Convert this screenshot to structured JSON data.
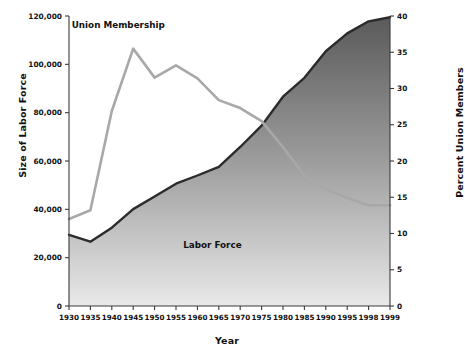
{
  "chart_data": {
    "type": "line",
    "title": "",
    "xlabel": "Year",
    "ylabel": "Size of Labor Force",
    "ylabel_right": "Percent Union Members",
    "categories": [
      "1930",
      "1935",
      "1940",
      "1945",
      "1950",
      "1955",
      "1960",
      "1965",
      "1970",
      "1975",
      "1980",
      "1985",
      "1990",
      "1995",
      "1998",
      "1999"
    ],
    "x": [
      1930,
      1935,
      1940,
      1945,
      1950,
      1955,
      1960,
      1965,
      1970,
      1975,
      1980,
      1985,
      1990,
      1995,
      1998,
      1999
    ],
    "xlim": [
      1930,
      1999
    ],
    "ylim": [
      0,
      120000
    ],
    "ylim_right": [
      0,
      40
    ],
    "yticks": [
      0,
      20000,
      40000,
      60000,
      80000,
      100000,
      120000
    ],
    "ytick_labels": [
      "0",
      "20,000",
      "40,000",
      "60,000",
      "80,000",
      "100,000",
      "120,000"
    ],
    "yticks_right": [
      0,
      5,
      10,
      15,
      20,
      25,
      30,
      35,
      40
    ],
    "ytick_labels_right": [
      "0",
      "5",
      "10",
      "15",
      "20",
      "25",
      "30",
      "35",
      "40"
    ],
    "grid": false,
    "legend_position": "inline-annotations",
    "series": [
      {
        "name": "Labor Force",
        "axis": "left",
        "type": "area",
        "units": "thousands of workers",
        "color": "#6e6e6e",
        "line_color": "#2b2b2b",
        "values": [
          29400,
          26600,
          32400,
          40100,
          45300,
          50600,
          54000,
          57600,
          65800,
          74600,
          86600,
          94400,
          105400,
          112800,
          117800,
          119500
        ]
      },
      {
        "name": "Union Membership",
        "axis": "right",
        "type": "line",
        "units": "percent of labor force",
        "color": "#a8a8a8",
        "values": [
          12.0,
          13.2,
          26.9,
          35.5,
          31.5,
          33.2,
          31.4,
          28.4,
          27.3,
          25.5,
          21.9,
          18.0,
          16.1,
          14.9,
          13.9,
          13.9
        ]
      }
    ],
    "annotations": [
      {
        "text": "Union Membership",
        "x": 1941.5,
        "y_right": 38.4
      },
      {
        "text": "Labor Force",
        "x": 1963.5,
        "y_left": 24000
      }
    ]
  }
}
